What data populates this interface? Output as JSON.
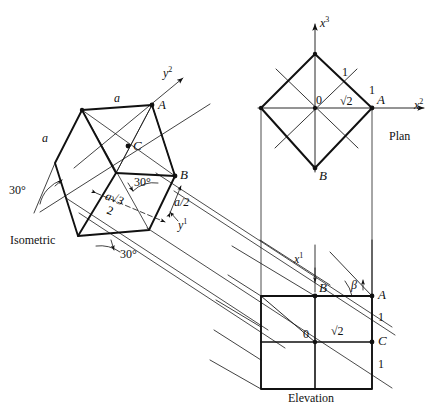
{
  "figure": {
    "stroke_color": "#111111",
    "background": "#ffffff"
  },
  "views": {
    "isometric": {
      "name": "Isometric",
      "labels": {
        "edge_a_top": "a",
        "edge_a_left": "a",
        "vertex_A": "A",
        "vertex_B": "B",
        "vertex_C": "C",
        "angle_left": "30°",
        "angle_middle": "30°",
        "angle_bottom": "30°",
        "dim_a_half": "a/2",
        "dim_numerator": "a√3",
        "dim_denominator": "2",
        "axis_y2": "y",
        "axis_y2_sup": "2",
        "axis_y1": "y",
        "axis_y1_sup": "1"
      }
    },
    "plan": {
      "name": "Plan",
      "labels": {
        "axis_x3": "x",
        "axis_x3_sup": "3",
        "axis_x2": "x",
        "axis_x2_sup": "2",
        "origin": "0",
        "unit_upper": "1",
        "unit_right": "1",
        "diagonal": "√2",
        "vertex_A": "A",
        "vertex_B": "B"
      }
    },
    "elevation": {
      "name": "Elevation",
      "labels": {
        "axis_x1": "x",
        "axis_x1_sup": "1",
        "vertex_A": "A",
        "vertex_B": "B",
        "vertex_C": "C",
        "origin": "0",
        "diagonal": "√2",
        "angle_beta": "β",
        "unit_upper": "1",
        "unit_lower": "1"
      }
    }
  }
}
